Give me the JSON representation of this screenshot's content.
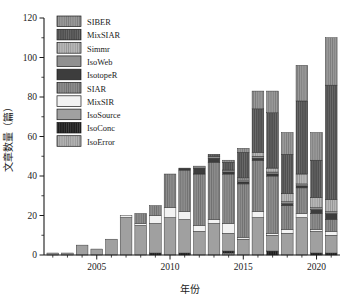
{
  "chart_data": {
    "type": "bar",
    "stacked": true,
    "title": "",
    "xlabel": "年份",
    "ylabel": "文章数量（篇）",
    "ylim": [
      0,
      120
    ],
    "ytick_values": [
      0,
      20,
      40,
      60,
      80,
      100,
      120
    ],
    "ytick_labels": [
      "0",
      "20",
      "40",
      "60",
      "80",
      "100",
      "120"
    ],
    "yminor_step": 10,
    "xtick_values": [
      2005,
      2010,
      2015,
      2020
    ],
    "xtick_labels": [
      "2005",
      "2010",
      "2015",
      "2020"
    ],
    "xlim": [
      2001.4,
      2021.6
    ],
    "grid": false,
    "legend_position": "upper-left-inside",
    "categories": [
      2002,
      2003,
      2004,
      2005,
      2006,
      2007,
      2008,
      2009,
      2010,
      2011,
      2012,
      2013,
      2014,
      2015,
      2016,
      2017,
      2018,
      2019,
      2020,
      2021
    ],
    "series": [
      {
        "name": "IsoError",
        "color": "#b4b4b4",
        "hatch": "vertical-lines",
        "values": [
          0,
          0,
          0,
          0,
          0,
          0,
          0,
          0,
          0,
          0,
          0,
          0,
          1,
          0,
          0,
          0,
          0,
          0,
          0,
          0
        ]
      },
      {
        "name": "IsoConc",
        "color": "#1c1c1c",
        "hatch": "vertical-lines",
        "values": [
          0,
          0,
          0,
          0,
          0,
          0,
          0,
          1,
          0,
          1,
          0,
          0,
          1,
          0,
          0,
          2,
          0,
          0,
          1,
          1
        ]
      },
      {
        "name": "IsoSource",
        "color": "#a0a0a0",
        "hatch": "none",
        "values": [
          1,
          1,
          5,
          3,
          8,
          19,
          15,
          15,
          19,
          17,
          12,
          16,
          9,
          8,
          19,
          8,
          11,
          19,
          11,
          9
        ]
      },
      {
        "name": "MixSIR",
        "color": "#f2f2f2",
        "hatch": "none",
        "values": [
          0,
          0,
          0,
          0,
          0,
          1,
          1,
          4,
          5,
          4,
          3,
          2,
          5,
          1,
          3,
          1,
          2,
          2,
          1,
          2
        ]
      },
      {
        "name": "SIAR",
        "color": "#8e8e8e",
        "hatch": "vertical-lines",
        "values": [
          0,
          0,
          0,
          0,
          0,
          0,
          5,
          5,
          17,
          21,
          26,
          29,
          25,
          27,
          26,
          29,
          12,
          13,
          8,
          6
        ]
      },
      {
        "name": "IsotopeR",
        "color": "#3d3d3d",
        "hatch": "none",
        "values": [
          0,
          0,
          0,
          0,
          0,
          0,
          0,
          0,
          0,
          1,
          3,
          2,
          1,
          1,
          1,
          1,
          1,
          1,
          2,
          3
        ]
      },
      {
        "name": "IsoWeb",
        "color": "#909090",
        "hatch": "none",
        "values": [
          0,
          0,
          0,
          0,
          0,
          0,
          0,
          0,
          0,
          0,
          1,
          1,
          1,
          1,
          1,
          1,
          1,
          1,
          1,
          1
        ]
      },
      {
        "name": "Simmr",
        "color": "#b8b8b8",
        "hatch": "vertical-lines",
        "values": [
          0,
          0,
          0,
          0,
          0,
          0,
          0,
          0,
          0,
          0,
          0,
          0,
          0,
          1,
          2,
          2,
          4,
          5,
          5,
          6
        ]
      },
      {
        "name": "MixSIAR",
        "color": "#4f4f4f",
        "hatch": "vertical-lines",
        "values": [
          0,
          0,
          0,
          0,
          0,
          0,
          0,
          0,
          0,
          0,
          0,
          1,
          4,
          13,
          22,
          28,
          20,
          37,
          19,
          58
        ]
      },
      {
        "name": "SIBER",
        "color": "#9a9a9a",
        "hatch": "vertical-lines",
        "values": [
          0,
          0,
          0,
          0,
          0,
          0,
          0,
          0,
          0,
          0,
          0,
          0,
          1,
          2,
          9,
          11,
          11,
          18,
          14,
          24
        ]
      }
    ],
    "legend_order_top_to_bottom": [
      "SIBER",
      "MixSIAR",
      "Simmr",
      "IsoWeb",
      "IsotopeR",
      "SIAR",
      "MixSIR",
      "IsoSource",
      "IsoConc",
      "IsoError"
    ]
  }
}
